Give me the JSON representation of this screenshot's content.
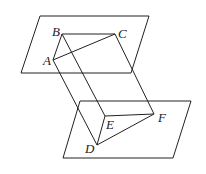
{
  "diagram": {
    "title": "",
    "type": "geometry-prism-between-parallel-planes",
    "points": {
      "A": {
        "label": "A",
        "x": 53,
        "y": 60
      },
      "B": {
        "label": "B",
        "x": 62,
        "y": 34
      },
      "C": {
        "label": "C",
        "x": 115,
        "y": 34
      },
      "D": {
        "label": "D",
        "x": 97,
        "y": 145
      },
      "E": {
        "label": "E",
        "x": 105,
        "y": 116
      },
      "F": {
        "label": "F",
        "x": 154,
        "y": 114
      }
    },
    "planes": [
      {
        "name": "upper-plane",
        "points": "40,16 149,16 131,73 21,73"
      },
      {
        "name": "lower-plane",
        "points": "80,101 191,101 173,158 63,158"
      }
    ],
    "edges": [
      [
        "A",
        "B"
      ],
      [
        "B",
        "C"
      ],
      [
        "A",
        "C"
      ],
      [
        "D",
        "E"
      ],
      [
        "E",
        "F"
      ],
      [
        "D",
        "F"
      ],
      [
        "A",
        "D"
      ],
      [
        "B",
        "E"
      ],
      [
        "C",
        "F"
      ]
    ],
    "stroke_color": "#222222"
  }
}
